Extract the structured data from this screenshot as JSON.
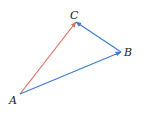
{
  "diagram": {
    "points": {
      "A": {
        "label": "A",
        "x": 20,
        "y": 94
      },
      "B": {
        "label": "B",
        "x": 121,
        "y": 52
      },
      "C": {
        "label": "C",
        "x": 76,
        "y": 22
      }
    },
    "vectors": [
      {
        "from": "A",
        "to": "C",
        "color": "#e0705e"
      },
      {
        "from": "A",
        "to": "B",
        "color": "#3b7dd0"
      },
      {
        "from": "B",
        "to": "C",
        "color": "#3b7dd0"
      }
    ]
  }
}
